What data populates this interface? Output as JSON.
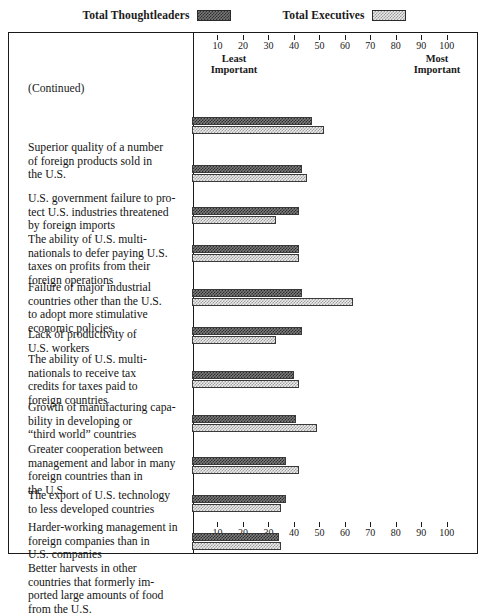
{
  "legend": {
    "entries": [
      {
        "label": "Total Thoughtleaders",
        "swatch": "dark-hatch-swatch",
        "color": "#2f2f2f"
      },
      {
        "label": "Total Executives",
        "swatch": "light-hatch-swatch",
        "color": "#9a9a9a"
      }
    ]
  },
  "notes": {
    "continued": "(Continued)"
  },
  "axis": {
    "ticks": [
      10,
      20,
      30,
      40,
      50,
      60,
      70,
      80,
      90,
      100
    ],
    "least_important": "Least\nImportant",
    "least_important_line1": "Least",
    "least_important_line2": "Important",
    "most_important_line1": "Most",
    "most_important_line2": "Important"
  },
  "chart_data": {
    "type": "bar",
    "orientation": "horizontal",
    "title": "",
    "subtitle": "(Continued)",
    "xlabel": "",
    "ylabel": "",
    "xlim": [
      0,
      104
    ],
    "grid": false,
    "legend_position": "top-center",
    "axis_low_label": "Least Important",
    "axis_high_label": "Most Important",
    "categories": [
      "Superior quality of a number of foreign products sold in the U.S.",
      "U.S. government failure to protect U.S. industries threatened by foreign imports",
      "The ability of U.S. multinationals to defer paying U.S. taxes on profits from their foreign operations",
      "Failure of major industrial countries other than the U.S. to adopt more stimulative economic policies",
      "Lack of productivity of U.S. workers",
      "The ability of U.S. multinationals to receive tax credits for taxes paid to foreign countries",
      "Growth of manufacturing capability in developing or “third world” countries",
      "Greater cooperation between management and labor in many foreign countries than in the U.S.",
      "The export of U.S. technology to less developed countries",
      "Harder-working management in foreign companies than in U.S. companies",
      "Better harvests in other countries that formerly imported large amounts of food from the U.S."
    ],
    "category_lines": [
      [
        "Superior quality of a number",
        "of foreign products sold in",
        "the U.S."
      ],
      [
        "U.S. government failure to pro-",
        "tect U.S. industries threatened",
        "by foreign imports"
      ],
      [
        "The ability of U.S. multi-",
        "nationals to defer paying U.S.",
        "taxes on profits from their",
        "foreign operations"
      ],
      [
        "Failure of major industrial",
        "countries other than the U.S.",
        "to adopt more stimulative",
        "economic policies"
      ],
      [
        "Lack of productivity of",
        "U.S. workers"
      ],
      [
        "The ability of U.S. multi-",
        "nationals to receive tax",
        "credits for taxes paid to",
        "foreign countries"
      ],
      [
        "Growth of manufacturing capa-",
        "bility in developing or",
        "“third world” countries"
      ],
      [
        "Greater cooperation between",
        "management and labor in many",
        "foreign countries than in",
        "the U.S."
      ],
      [
        "The export of U.S. technology",
        "to less developed countries"
      ],
      [
        "Harder-working management in",
        "foreign companies than in",
        "U.S. companies"
      ],
      [
        "Better harvests in other",
        "countries that formerly im-",
        "ported large amounts of food",
        "from the U.S."
      ]
    ],
    "series": [
      {
        "name": "Total Thoughtleaders",
        "values": [
          47,
          43,
          42,
          42,
          43,
          43,
          40,
          41,
          37,
          37,
          34
        ]
      },
      {
        "name": "Total Executives",
        "values": [
          52,
          45,
          33,
          42,
          63,
          33,
          42,
          49,
          42,
          35,
          35
        ]
      }
    ]
  },
  "layout": {
    "row_tops": [
      84,
      132,
      174,
      212,
      256,
      294,
      338,
      382,
      424,
      462,
      500
    ],
    "label_tops": [
      76,
      127,
      168,
      216,
      263,
      288,
      336,
      378,
      424,
      456,
      497
    ]
  }
}
